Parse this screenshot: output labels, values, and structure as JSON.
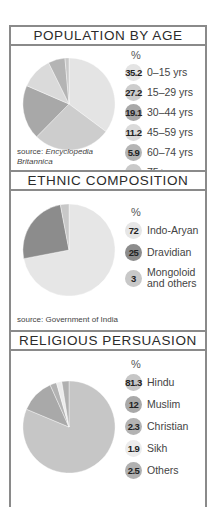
{
  "sections": [
    {
      "title": "POPULATION BY AGE",
      "unit": "%",
      "source_prefix": "source: ",
      "source_name": "Encyclopedia Britannica",
      "items": [
        {
          "value": "35.2",
          "label": "0–15 yrs",
          "color": "#e4e4e4"
        },
        {
          "value": "27.2",
          "label": "15–29 yrs",
          "color": "#cdcdcd"
        },
        {
          "value": "19.1",
          "label": "30–44 yrs",
          "color": "#a8a8a8"
        },
        {
          "value": "11.2",
          "label": "45–59 yrs",
          "color": "#dadada"
        },
        {
          "value": "5.9",
          "label": "60–74 yrs",
          "color": "#b4b4b4"
        },
        {
          "value": "1.4",
          "label": "75+ yrs",
          "color": "#c9c9c9"
        }
      ]
    },
    {
      "title": "ETHNIC COMPOSITION",
      "unit": "%",
      "source_prefix": "source: ",
      "source_name": "Government of India",
      "items": [
        {
          "value": "72",
          "label": "Indo-Aryan",
          "color": "#e6e6e6"
        },
        {
          "value": "25",
          "label": "Dravidian",
          "color": "#8c8c8c"
        },
        {
          "value": "3",
          "label": "Mongoloid and others",
          "color": "#c8c8c8"
        }
      ]
    },
    {
      "title": "RELIGIOUS PERSUASION",
      "unit": "%",
      "items": [
        {
          "value": "81.3",
          "label": "Hindu",
          "color": "#c6c6c6"
        },
        {
          "value": "12",
          "label": "Muslim",
          "color": "#a9a9a9"
        },
        {
          "value": "2.3",
          "label": "Christian",
          "color": "#b3b3b3"
        },
        {
          "value": "1.9",
          "label": "Sikh",
          "color": "#ececec"
        },
        {
          "value": "2.5",
          "label": "Others",
          "color": "#b0b0b0"
        }
      ]
    }
  ],
  "chart_data": [
    {
      "type": "pie",
      "title": "POPULATION BY AGE",
      "unit": "%",
      "categories": [
        "0–15 yrs",
        "15–29 yrs",
        "30–44 yrs",
        "45–59 yrs",
        "60–74 yrs",
        "75+ yrs"
      ],
      "values": [
        35.2,
        27.2,
        19.1,
        11.2,
        5.9,
        1.4
      ],
      "source": "Encyclopedia Britannica",
      "legend_position": "right"
    },
    {
      "type": "pie",
      "title": "ETHNIC COMPOSITION",
      "unit": "%",
      "categories": [
        "Indo-Aryan",
        "Dravidian",
        "Mongoloid and others"
      ],
      "values": [
        72,
        25,
        3
      ],
      "source": "Government of India",
      "legend_position": "right"
    },
    {
      "type": "pie",
      "title": "RELIGIOUS PERSUASION",
      "unit": "%",
      "categories": [
        "Hindu",
        "Muslim",
        "Christian",
        "Sikh",
        "Others"
      ],
      "values": [
        81.3,
        12,
        2.3,
        1.9,
        2.5
      ],
      "legend_position": "right"
    }
  ]
}
